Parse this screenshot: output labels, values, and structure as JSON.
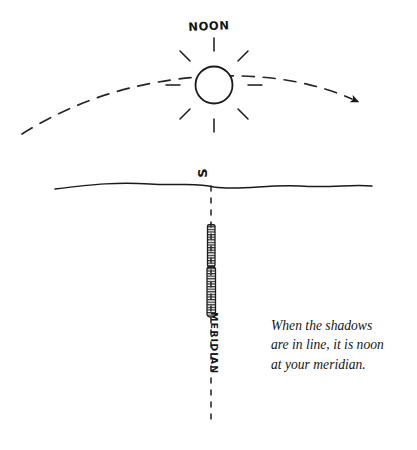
{
  "figure": {
    "kind": "hand-drawn-diagram",
    "title_label": "NOON",
    "horizon_direction_label": "S",
    "meridian_label": "MERIDIAN",
    "caption": {
      "line1": "When the shadows",
      "line2": "are in line, it is noon",
      "line3": "at your meridian."
    }
  },
  "colors": {
    "ink": "#1a1a1a",
    "paper": "#ffffff",
    "arc": "#2b2b2b",
    "marker_fill": "#3a3a3a"
  },
  "elements": {
    "sun": {
      "name": "sun-icon",
      "center_x": 214,
      "center_y": 85,
      "radius": 18,
      "ray_count": 8
    },
    "sun_path_arc": {
      "name": "sun-path-arc",
      "style": "dashed",
      "start_x": 22,
      "start_y": 133,
      "end_x": 358,
      "end_y": 101,
      "arrowhead": "right"
    },
    "horizon": {
      "name": "horizon-line",
      "start_x": 55,
      "end_x": 372,
      "y": 185,
      "style": "wavy-solid"
    },
    "meridian_line": {
      "name": "meridian-dashed-line",
      "x": 211,
      "top_y": 186,
      "bottom_y": 421,
      "style": "dashed"
    },
    "shadow_marker_upper": {
      "name": "shadow-marker-upper",
      "x": 211,
      "top_y": 224,
      "bottom_y": 268
    },
    "shadow_marker_lower": {
      "name": "shadow-marker-lower",
      "x": 211,
      "top_y": 266,
      "bottom_y": 318
    }
  }
}
